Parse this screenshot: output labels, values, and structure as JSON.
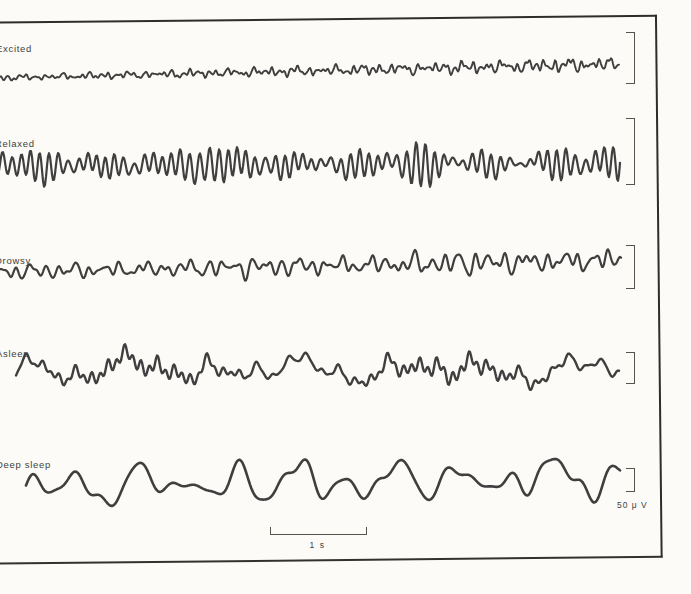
{
  "chart_data": {
    "type": "line",
    "title": "",
    "legend": "none",
    "grid": false,
    "x_axis": {
      "scale_bar_label": "1 s",
      "scale_bar_seconds": 1
    },
    "y_axis": {
      "calibration_label": "50 μ V",
      "calibration_microvolts": 50
    },
    "series": [
      {
        "label": "Excited",
        "label_pos": {
          "x": -4,
          "y": 43
        },
        "x_start": -6,
        "x_end": 619,
        "center_y": 73,
        "trend": [
          5,
          -9
        ],
        "amp_trend": [
          0.45,
          1.2
        ],
        "components": [
          {
            "T": 6.3,
            "a": 2.6,
            "p": 0.5,
            "env": {
              "P": 90,
              "d": 0.45,
              "ph": 0.8
            }
          },
          {
            "T": 9.1,
            "a": 2.2,
            "p": 2.1
          },
          {
            "T": 13.7,
            "a": 1.8,
            "p": 4.2
          },
          {
            "T": 21.0,
            "a": 1.5,
            "p": 1.0
          },
          {
            "T": 34.0,
            "a": 1.3,
            "p": 3.3
          },
          {
            "T": 4.3,
            "a": 0.9,
            "p": 0.2
          }
        ],
        "bracket": {
          "x": 626,
          "top": 32,
          "height": 50
        }
      },
      {
        "label": "Relaxed",
        "label_pos": {
          "x": -5,
          "y": 138
        },
        "x_start": -6,
        "x_end": 620,
        "center_y": 166,
        "trend": [
          0,
          -3
        ],
        "amp_trend": [
          1.05,
          1.05
        ],
        "components": [
          {
            "T": 9.4,
            "a": 13.0,
            "p": 0.0,
            "env": {
              "P": 200,
              "d": 0.55,
              "ph": 1.2
            }
          },
          {
            "T": 8.2,
            "a": 5.0,
            "p": 2.5,
            "env": {
              "P": 160,
              "d": 0.5,
              "ph": 4.0
            }
          },
          {
            "T": 10.8,
            "a": 4.0,
            "p": 4.8,
            "env": {
              "P": 240,
              "d": 0.5,
              "ph": 2.6
            }
          },
          {
            "T": 30.0,
            "a": 2.5,
            "p": 1.8
          },
          {
            "T": 75.0,
            "a": 2.0,
            "p": 0.7
          }
        ],
        "bracket": {
          "x": 626,
          "top": 118,
          "height": 65
        }
      },
      {
        "label": "Drowsy",
        "label_pos": {
          "x": -5,
          "y": 255
        },
        "x_start": -6,
        "x_end": 621,
        "center_y": 269,
        "trend": [
          3,
          -9
        ],
        "amp_trend": [
          0.65,
          1.15
        ],
        "components": [
          {
            "T": 14.8,
            "a": 6.5,
            "p": 1.1,
            "env": {
              "P": 210,
              "d": 0.5,
              "ph": 0.3
            }
          },
          {
            "T": 10.2,
            "a": 3.5,
            "p": 3.9
          },
          {
            "T": 22.5,
            "a": 3.5,
            "p": 5.6,
            "env": {
              "P": 260,
              "d": 0.45,
              "ph": 3.6
            }
          },
          {
            "T": 38.0,
            "a": 3.0,
            "p": 2.2
          },
          {
            "T": 7.3,
            "a": 1.2,
            "p": 0.9
          }
        ],
        "bracket": {
          "x": 626,
          "top": 245,
          "height": 42
        }
      },
      {
        "label": "Asleep",
        "label_pos": {
          "x": -4,
          "y": 348
        },
        "x_start": 16,
        "x_end": 619,
        "center_y": 369,
        "trend": [
          0,
          2
        ],
        "amp_trend": [
          1.0,
          1.0
        ],
        "components": [
          {
            "T": 8.2,
            "a": 5.5,
            "p": 0.3,
            "env": {
              "P": 310,
              "d": 0.88,
              "ph": -1.27
            }
          },
          {
            "T": 26.0,
            "a": 5.0,
            "p": 1.9,
            "env": {
              "P": 230,
              "d": 0.5,
              "ph": 2.2
            }
          },
          {
            "T": 16.5,
            "a": 3.5,
            "p": 4.4
          },
          {
            "T": 44.0,
            "a": 5.0,
            "p": 3.0
          },
          {
            "T": 90.0,
            "a": 6.0,
            "p": 5.3
          },
          {
            "T": 150.0,
            "a": 5.0,
            "p": 2.0
          }
        ],
        "bracket": {
          "x": 626,
          "top": 352,
          "height": 30
        }
      },
      {
        "label": "Deep sleep",
        "label_pos": {
          "x": -4,
          "y": 459
        },
        "x_start": 26,
        "x_end": 620,
        "center_y": 479,
        "trend": [
          8,
          -2
        ],
        "amp_trend": [
          0.75,
          0.8
        ],
        "components": [
          {
            "T": 53.0,
            "a": 16.0,
            "p": 4.4,
            "env": {
              "P": 620,
              "d": 0.35,
              "ph": -1.3
            }
          },
          {
            "T": 34.0,
            "a": 9.0,
            "p": 1.2,
            "env": {
              "P": 300,
              "d": 0.4,
              "ph": 2.0
            }
          },
          {
            "T": 81.0,
            "a": 11.0,
            "p": 2.8
          },
          {
            "T": 23.0,
            "a": 5.0,
            "p": 5.5,
            "env": {
              "P": 260,
              "d": 0.5,
              "ph": 0.6
            }
          },
          {
            "T": 131.0,
            "a": 5.0,
            "p": 0.4
          }
        ],
        "bracket": {
          "x": 626,
          "top": 468,
          "height": 22
        }
      }
    ],
    "scale_bar": {
      "x": 270,
      "y": 527,
      "width": 95,
      "tick_height": 7,
      "label": "1 s",
      "label_y": 540
    },
    "voltage_label": {
      "text": "50 μ V",
      "x": 617,
      "y": 500
    }
  },
  "colors": {
    "trace": "#3f3f3f",
    "frame": "#2f2d29",
    "calibration": "#56534d",
    "paper": "#fcfbf8"
  }
}
